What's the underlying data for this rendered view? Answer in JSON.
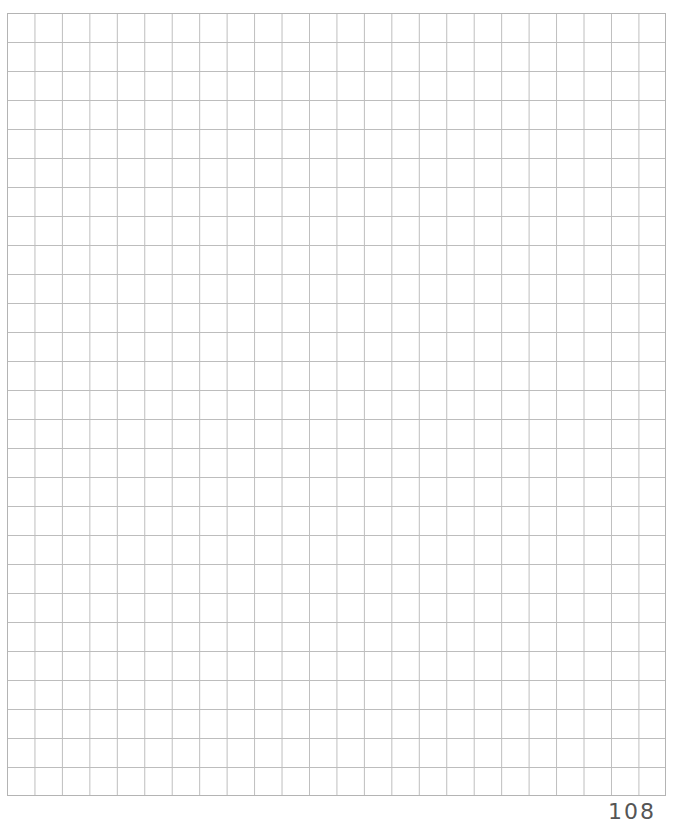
{
  "sheet": {
    "type": "grid-paper",
    "columns": 24,
    "rows": 27,
    "line_color": "#bdbdbd",
    "background": "#ffffff"
  },
  "footer": {
    "page_number": "108"
  }
}
